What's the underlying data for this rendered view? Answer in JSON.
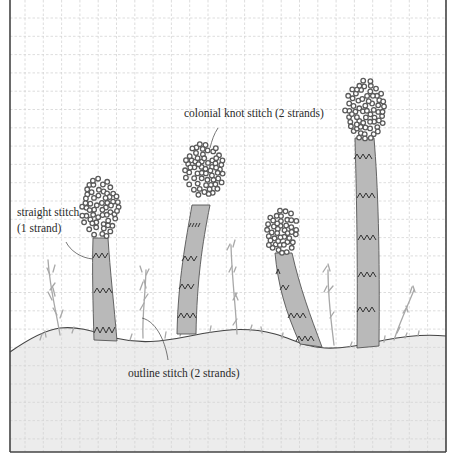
{
  "figure": {
    "type": "embroidery stitch diagram",
    "grid": {
      "spacing_px": 18.3,
      "line_color": "#d6d6d6",
      "style": "dashed"
    },
    "colors": {
      "background": "#ffffff",
      "ground_fill": "#ececec",
      "stem_fill": "#b9b9b9",
      "stem_outline": "#555555",
      "knot_color": "#5a5a5a",
      "grass_color": "#a8a8a8",
      "border": "#444444",
      "zigzag": "#333333"
    },
    "labels": {
      "colonial_knot": "colonial knot stitch (2 strands)",
      "straight_stitch_line1": "straight stitch",
      "straight_stitch_line2": "(1 strand)",
      "outline_stitch": "outline stitch (2 strands)"
    },
    "elements": [
      {
        "name": "mushroom-1",
        "description": "short stem with oval knot cap, left"
      },
      {
        "name": "mushroom-2",
        "description": "curving stem with oval knot cap"
      },
      {
        "name": "mushroom-3",
        "description": "bent stem with round knot cap"
      },
      {
        "name": "mushroom-4",
        "description": "tall straight stem with tall oval knot cap, right"
      }
    ]
  }
}
